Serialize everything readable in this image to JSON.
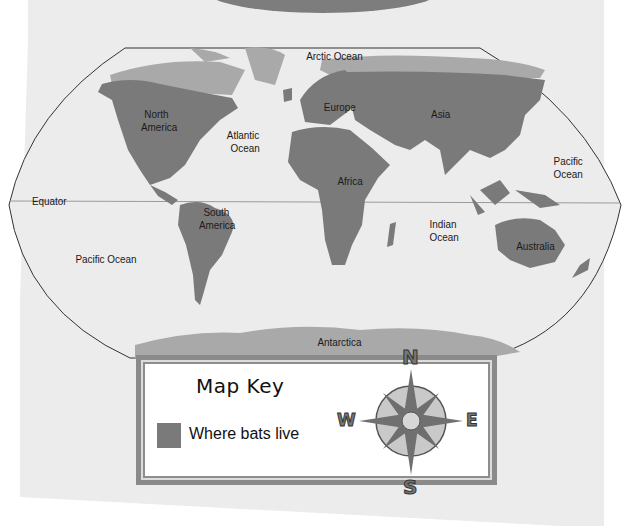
{
  "map": {
    "title": "Where bats live",
    "colors": {
      "paper": "#ececec",
      "bat_land": "#7a7a7a",
      "other_land": "#a9a9a9",
      "outline": "#333333",
      "top_oval": "#7d7d7d"
    },
    "labels": {
      "arctic_ocean": "Arctic Ocean",
      "north_america_1": "North",
      "north_america_2": "America",
      "europe": "Europe",
      "asia": "Asia",
      "atlantic_1": "Atlantic",
      "atlantic_2": "Ocean",
      "pacific_east_1": "Pacific",
      "pacific_east_2": "Ocean",
      "equator": "Equator",
      "africa": "Africa",
      "south_america_1": "South",
      "south_america_2": "America",
      "indian_1": "Indian",
      "indian_2": "Ocean",
      "australia": "Australia",
      "pacific_west": "Pacific Ocean",
      "antarctica": "Antarctica"
    }
  },
  "key": {
    "title": "Map Key",
    "items": [
      {
        "label": "Where bats live",
        "color": "#7a7a7a"
      }
    ]
  },
  "compass": {
    "north": "N",
    "south": "S",
    "east": "E",
    "west": "W"
  }
}
